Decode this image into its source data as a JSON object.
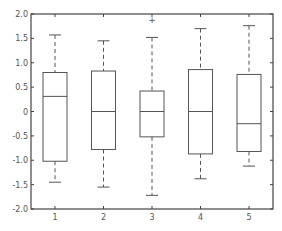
{
  "chart_data": {
    "type": "boxplot",
    "title": "",
    "xlabel": "",
    "ylabel": "",
    "ylim": [
      -2.0,
      2.0
    ],
    "grid": false,
    "legend": null,
    "categories": [
      "1",
      "2",
      "3",
      "4",
      "5"
    ],
    "y_ticks": [
      "2.0",
      "1.5",
      "1.0",
      "0.5",
      "0",
      "-0.5",
      "-1.0",
      "-1.5",
      "-2.0"
    ],
    "y_tick_values": [
      2.0,
      1.5,
      1.0,
      0.5,
      0,
      -0.5,
      -1.0,
      -1.5,
      -2.0
    ],
    "boxes": [
      {
        "label": "1",
        "whisker_high": 1.57,
        "q3": 0.8,
        "median": 0.31,
        "q1": -1.02,
        "whisker_low": -1.45,
        "outliers": []
      },
      {
        "label": "2",
        "whisker_high": 1.45,
        "q3": 0.83,
        "median": 0.0,
        "q1": -0.78,
        "whisker_low": -1.55,
        "outliers": []
      },
      {
        "label": "3",
        "whisker_high": 1.52,
        "q3": 0.42,
        "median": 0.0,
        "q1": -0.52,
        "whisker_low": -1.72,
        "outliers": [
          1.87
        ]
      },
      {
        "label": "4",
        "whisker_high": 1.7,
        "q3": 0.86,
        "median": 0.0,
        "q1": -0.87,
        "whisker_low": -1.38,
        "outliers": []
      },
      {
        "label": "5",
        "whisker_high": 1.76,
        "q3": 0.76,
        "median": -0.25,
        "q1": -0.82,
        "whisker_low": -1.12,
        "outliers": []
      }
    ],
    "colors": {
      "line": "#555555",
      "axis": "#444444",
      "background": "#ffffff"
    }
  },
  "caption": ""
}
